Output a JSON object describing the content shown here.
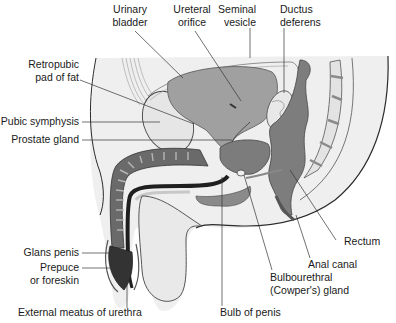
{
  "diagram": {
    "type": "anatomical-illustration",
    "palette": {
      "background": "#ffffff",
      "pelvis_fill": "#ededed",
      "organ_mid": "#9a9a9a",
      "organ_dark": "#6f6f6f",
      "erectile_dark": "#3a3a3a",
      "urethra": "#1f1f1f",
      "outline": "#2b2b2b",
      "leader_line": "#333333",
      "text": "#1a1a1a"
    },
    "labels": {
      "urinary_bladder": [
        "Urinary",
        "bladder"
      ],
      "ureteral_orifice": [
        "Ureteral",
        "orifice"
      ],
      "seminal_vesicle": [
        "Seminal",
        "vesicle"
      ],
      "ductus_deferens": [
        "Ductus",
        "deferens"
      ],
      "retropubic_fat": [
        "Retropubic",
        "pad of fat"
      ],
      "pubic_symphysis": [
        "Pubic symphysis"
      ],
      "prostate_gland": [
        "Prostate gland"
      ],
      "rectum": [
        "Rectum"
      ],
      "anal_canal": [
        "Anal canal"
      ],
      "glans_penis": [
        "Glans penis"
      ],
      "prepuce": [
        "Prepuce",
        "or foreskin"
      ],
      "external_meatus": [
        "External meatus of urethra"
      ],
      "bulbourethral_gland": [
        "Bulbourethral",
        "(Cowper's) gland"
      ],
      "bulb_of_penis": [
        "Bulb of penis"
      ]
    }
  }
}
